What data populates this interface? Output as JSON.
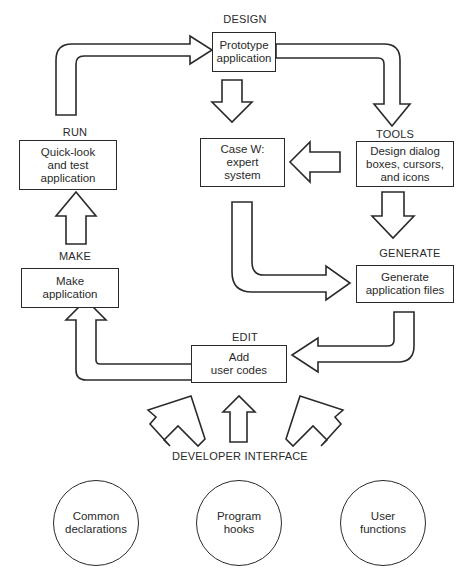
{
  "stages": {
    "design": {
      "heading": "DESIGN",
      "text": "Prototype\napplication"
    },
    "tools": {
      "heading": "TOOLS",
      "text": "Design dialog\nboxes, cursors,\nand icons"
    },
    "casew": {
      "text": "Case W:\nexpert\nsystem"
    },
    "run": {
      "heading": "RUN",
      "text": "Quick-look\nand test\napplication"
    },
    "make": {
      "heading": "MAKE",
      "text": "Make\napplication"
    },
    "generate": {
      "heading": "GENERATE",
      "text": "Generate\napplication files"
    },
    "edit": {
      "heading": "EDIT",
      "text": "Add\nuser codes"
    }
  },
  "developer_interface": {
    "heading": "DEVELOPER INTERFACE",
    "items": [
      {
        "text": "Common\ndeclarations"
      },
      {
        "text": "Program\nhooks"
      },
      {
        "text": "User\nfunctions"
      }
    ]
  }
}
